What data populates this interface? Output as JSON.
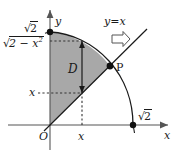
{
  "figure": {
    "type": "math-diagram",
    "axes": {
      "x_label": "x",
      "y_label": "y",
      "origin_label": "O"
    },
    "labels": {
      "region": "D",
      "point_p": "P",
      "line": "y=x",
      "y_intercept_radicand": "2",
      "x_intercept_radicand": "2",
      "upper_bound_radicand": "2 − x",
      "upper_bound_exponent": "2",
      "left_tick": "x",
      "bottom_tick": "x",
      "radical_sign": "√"
    },
    "colors": {
      "shade_fill": "#a8a8a8",
      "stroke": "#1a1a1a",
      "axis": "#555555",
      "dashed": "#333333",
      "point": "#111111",
      "background": "#ffffff"
    },
    "geometry": {
      "origin_px": [
        50,
        125
      ],
      "radius_x_px": 83,
      "radius_y_px": 93,
      "point_p_px": [
        110,
        66
      ],
      "x_value_px": 82,
      "arc_label_value": "√2"
    }
  }
}
